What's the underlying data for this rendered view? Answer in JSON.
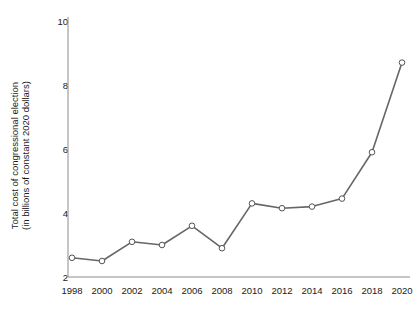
{
  "chart_data": {
    "type": "line",
    "title": "",
    "xlabel": "",
    "ylabel": "Total cost of congressional election\n(in billions of constant 2020 dollars)",
    "categories": [
      1998,
      2000,
      2002,
      2004,
      2006,
      2008,
      2010,
      2012,
      2014,
      2016,
      2018,
      2020
    ],
    "values": [
      2.6,
      2.5,
      3.1,
      3.0,
      3.6,
      2.9,
      4.3,
      4.15,
      4.2,
      4.45,
      5.9,
      8.7
    ],
    "xtick_labels": [
      "1998",
      "2000",
      "2002",
      "2004",
      "2006",
      "2008",
      "2010",
      "2012",
      "2014",
      "2016",
      "2018",
      "2020"
    ],
    "ytick_labels": [
      "2",
      "4",
      "6",
      "8",
      "10"
    ],
    "ytick_values": [
      2,
      4,
      6,
      8,
      10
    ],
    "ylim": [
      1.7,
      10.0
    ],
    "xlim": [
      1997,
      2021
    ],
    "grid": false,
    "legend": null,
    "series": [
      {
        "name": "Total cost of congressional election",
        "values": [
          2.6,
          2.5,
          3.1,
          3.0,
          3.6,
          2.9,
          4.3,
          4.15,
          4.2,
          4.45,
          5.9,
          8.7
        ],
        "line_color": "#666666",
        "marker": "open-circle",
        "marker_face_color": "#ffffff",
        "marker_edge_color": "#555555"
      }
    ],
    "axis_color": "#8c8c8c",
    "text_color": "#1a1a1a",
    "background_color": "#ffffff"
  }
}
